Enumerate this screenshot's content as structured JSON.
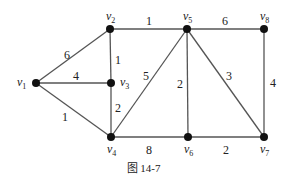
{
  "figure": {
    "caption": "图 14-7",
    "colors": {
      "edge": "#555555",
      "node": "#111111",
      "text": "#222222"
    }
  },
  "graph": {
    "nodes": [
      {
        "id": "v1",
        "letter": "v",
        "sub": "1",
        "x": 36,
        "y": 83
      },
      {
        "id": "v2",
        "letter": "v",
        "sub": "2",
        "x": 110,
        "y": 29
      },
      {
        "id": "v3",
        "letter": "v",
        "sub": "3",
        "x": 111,
        "y": 83
      },
      {
        "id": "v4",
        "letter": "v",
        "sub": "4",
        "x": 111,
        "y": 137
      },
      {
        "id": "v5",
        "letter": "v",
        "sub": "5",
        "x": 187,
        "y": 29
      },
      {
        "id": "v6",
        "letter": "v",
        "sub": "6",
        "x": 188,
        "y": 137
      },
      {
        "id": "v7",
        "letter": "v",
        "sub": "7",
        "x": 264,
        "y": 137
      },
      {
        "id": "v8",
        "letter": "v",
        "sub": "8",
        "x": 264,
        "y": 29
      }
    ],
    "edges": [
      {
        "from": "v1",
        "to": "v2",
        "weight": "6"
      },
      {
        "from": "v1",
        "to": "v3",
        "weight": "4"
      },
      {
        "from": "v1",
        "to": "v4",
        "weight": "1"
      },
      {
        "from": "v2",
        "to": "v3",
        "weight": "1"
      },
      {
        "from": "v3",
        "to": "v4",
        "weight": "2"
      },
      {
        "from": "v2",
        "to": "v5",
        "weight": "1"
      },
      {
        "from": "v4",
        "to": "v5",
        "weight": "5"
      },
      {
        "from": "v4",
        "to": "v6",
        "weight": "8"
      },
      {
        "from": "v5",
        "to": "v6",
        "weight": "2"
      },
      {
        "from": "v5",
        "to": "v7",
        "weight": "3"
      },
      {
        "from": "v5",
        "to": "v8",
        "weight": "6"
      },
      {
        "from": "v6",
        "to": "v7",
        "weight": "2"
      },
      {
        "from": "v8",
        "to": "v7",
        "weight": "4"
      }
    ]
  }
}
